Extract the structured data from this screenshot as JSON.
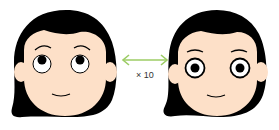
{
  "diagram": {
    "type": "comparison",
    "left_figure": {
      "description": "cartoon girl face with eyes looking upward",
      "gaze": "up",
      "eye_style": "thin ring, pupil near top"
    },
    "right_figure": {
      "description": "cartoon girl face with eyes looking straight ahead",
      "gaze": "center",
      "eye_style": "thick ring, centered pupil"
    },
    "connector": {
      "type": "double-headed-arrow",
      "label": "× 10",
      "color": "#9ccc65"
    }
  },
  "colors": {
    "hair": "#000000",
    "skin": "#fde0c8",
    "eye_white": "#ffffff",
    "pupil": "#000000",
    "arrow": "#9ccc65",
    "background": "#ffffff"
  }
}
